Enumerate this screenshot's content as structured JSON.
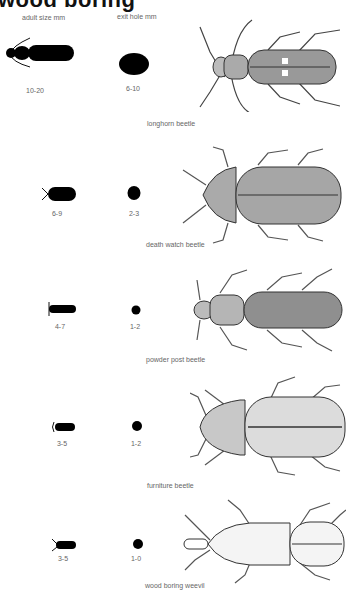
{
  "title": "wood boring",
  "headers": {
    "adult_size": "adult size mm",
    "exit_hole": "exit hole mm"
  },
  "insects": [
    {
      "name": "longhorn beetle",
      "adult_size": "10-20",
      "exit_hole": "6-10"
    },
    {
      "name": "death watch beetle",
      "adult_size": "6-9",
      "exit_hole": "2-3"
    },
    {
      "name": "powder post  beetle",
      "adult_size": "4-7",
      "exit_hole": "1-2"
    },
    {
      "name": "furniture  beetle",
      "adult_size": "3-5",
      "exit_hole": "1-2"
    },
    {
      "name": "wood boring weevil",
      "adult_size": "3-5",
      "exit_hole": "1-0"
    }
  ]
}
